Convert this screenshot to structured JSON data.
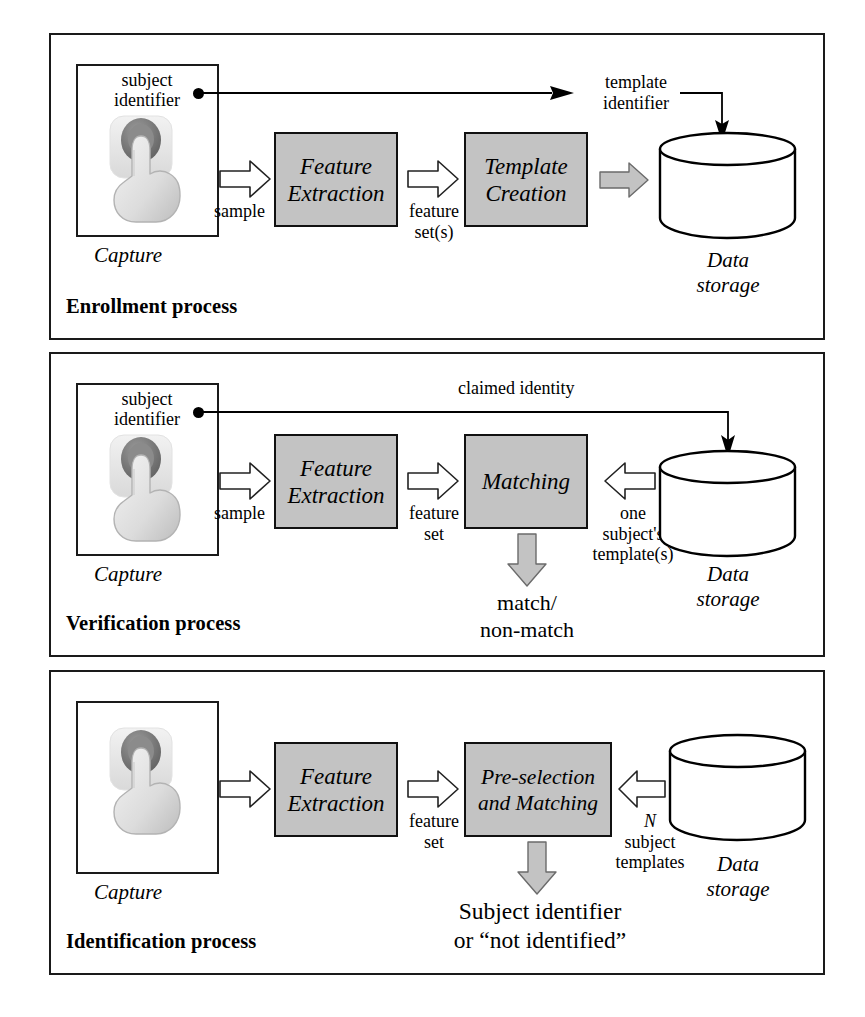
{
  "figure": {
    "colors": {
      "process_box_fill": "#c3c3c3",
      "outline": "#111111",
      "filled_arrow": "#c3c3c3",
      "hollow_arrow": "#ffffff",
      "page_background": "#ffffff"
    }
  },
  "panels": [
    {
      "id": "enrollment",
      "caption": "Enrollment process",
      "capture": {
        "label": "Capture",
        "subject_identifier": "subject\nidentifier",
        "subject_identifier_line1": "subject",
        "subject_identifier_line2": "identifier",
        "icon": "finger-on-sensor-icon",
        "has_node_dot": true
      },
      "stages": [
        {
          "name": "feature-extraction",
          "line1": "Feature",
          "line2": "Extraction"
        },
        {
          "name": "template-creation",
          "line1": "Template",
          "line2": "Creation"
        }
      ],
      "flow_labels": [
        {
          "name": "sample",
          "text": "sample"
        },
        {
          "name": "feature-sets",
          "line1": "feature",
          "line2": "set(s)"
        }
      ],
      "top_link": {
        "name": "template-identifier",
        "line1": "template",
        "line2": "identifier"
      },
      "storage": {
        "line1": "Data",
        "line2": "storage"
      },
      "outputs": []
    },
    {
      "id": "verification",
      "caption": "Verification process",
      "capture": {
        "label": "Capture",
        "subject_identifier_line1": "subject",
        "subject_identifier_line2": "identifier",
        "icon": "finger-on-sensor-icon",
        "has_node_dot": true
      },
      "stages": [
        {
          "name": "feature-extraction",
          "line1": "Feature",
          "line2": "Extraction"
        },
        {
          "name": "matching",
          "line1": "Matching",
          "line2": ""
        }
      ],
      "flow_labels": [
        {
          "name": "sample",
          "text": "sample"
        },
        {
          "name": "feature-set",
          "line1": "feature",
          "line2": "set"
        },
        {
          "name": "one-subjects-templates",
          "line1": "one",
          "line2": "subject's",
          "line3": "template(s)"
        }
      ],
      "top_link": {
        "name": "claimed-identity",
        "text": "claimed identity"
      },
      "storage": {
        "line1": "Data",
        "line2": "storage"
      },
      "outputs": [
        {
          "name": "match-result",
          "line1": "match/",
          "line2": "non-match"
        }
      ]
    },
    {
      "id": "identification",
      "caption": "Identification process",
      "capture": {
        "label": "Capture",
        "icon": "finger-on-sensor-icon",
        "has_node_dot": false
      },
      "stages": [
        {
          "name": "feature-extraction",
          "line1": "Feature",
          "line2": "Extraction"
        },
        {
          "name": "pre-selection-and-matching",
          "line1": "Pre-selection",
          "line2": "and Matching"
        }
      ],
      "flow_labels": [
        {
          "name": "feature-set",
          "line1": "feature",
          "line2": "set"
        },
        {
          "name": "n-subject-templates",
          "line1": "N",
          "line2": "subject",
          "line3": "templates"
        }
      ],
      "storage": {
        "line1": "Data",
        "line2": "storage"
      },
      "outputs": [
        {
          "name": "identification-result",
          "line1": "Subject identifier",
          "line2": "or “not identified”"
        }
      ]
    }
  ]
}
